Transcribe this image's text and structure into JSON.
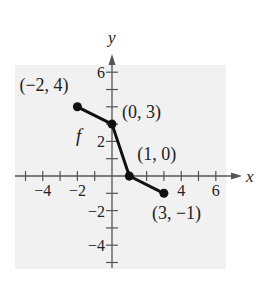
{
  "chart_data": {
    "type": "line",
    "title": "",
    "xlabel": "x",
    "ylabel": "y",
    "function_label": "f",
    "series": [
      {
        "name": "f",
        "points": [
          {
            "x": -2,
            "y": 4,
            "label": "(−2, 4)"
          },
          {
            "x": 0,
            "y": 3,
            "label": "(0, 3)"
          },
          {
            "x": 1,
            "y": 0,
            "label": "(1, 0)"
          },
          {
            "x": 3,
            "y": -1,
            "label": "(3, −1)"
          }
        ]
      }
    ],
    "xlim": [
      -5,
      7
    ],
    "ylim": [
      -5,
      7
    ],
    "x_ticks": [
      -5,
      -4,
      -3,
      -2,
      -1,
      1,
      2,
      3,
      4,
      5,
      6
    ],
    "y_ticks": [
      -5,
      -4,
      -3,
      -2,
      -1,
      1,
      2,
      3,
      4,
      5,
      6
    ],
    "x_tick_labels": [
      {
        "value": -4,
        "text": "−4"
      },
      {
        "value": -2,
        "text": "−2"
      },
      {
        "value": 4,
        "text": "4"
      },
      {
        "value": 6,
        "text": "6"
      }
    ],
    "y_tick_labels": [
      {
        "value": 6,
        "text": "6"
      },
      {
        "value": 2,
        "text": "2"
      },
      {
        "value": -2,
        "text": "−2"
      },
      {
        "value": -4,
        "text": "−4"
      }
    ],
    "grid": false,
    "colors": {
      "panel": "#f1f1f1",
      "axis": "#555555",
      "line": "#111111"
    }
  }
}
